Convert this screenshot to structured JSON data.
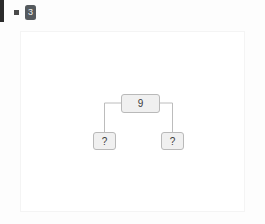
{
  "topbar": {
    "bullet_icon": "square-bullet-icon",
    "badge_value": "3"
  },
  "canvas": {
    "title": ""
  },
  "diagram": {
    "type": "binary-tree",
    "nodes": [
      {
        "id": "root",
        "label": "9",
        "role": "root"
      },
      {
        "id": "left",
        "label": "?",
        "role": "leaf"
      },
      {
        "id": "right",
        "label": "?",
        "role": "leaf"
      }
    ],
    "edges": [
      {
        "from": "root",
        "to": "left",
        "style": "orthogonal"
      },
      {
        "from": "root",
        "to": "right",
        "style": "orthogonal"
      }
    ],
    "colors": {
      "node_fill": "#f0f0f0",
      "node_border": "#b9b9b9",
      "edge": "#bcbcbc",
      "text": "#3b3b3b"
    }
  }
}
